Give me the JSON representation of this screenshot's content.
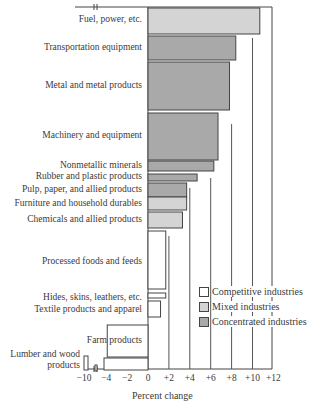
{
  "chart_data": {
    "type": "bar",
    "orientation": "horizontal",
    "title": "",
    "xlabel": "Percent change",
    "ylabel": "",
    "xlim": [
      -10,
      12
    ],
    "x_ticks": [
      "−10",
      "−4",
      "−2",
      "0",
      "+2",
      "+4",
      "+6",
      "+8",
      "+10",
      "+12"
    ],
    "axis_break": "between −10 and −4",
    "categories": [
      "Fuel, power, etc.",
      "Transportation equipment",
      "Metal and metal products",
      "Machinery and equipment",
      "Nonmetallic minerals",
      "Rubber and plastic products",
      "Pulp, paper, and allied products",
      "Furniture and household durables",
      "Chemicals and allied products",
      "Processed foods and feeds",
      "Hides, skins, leathers, etc.",
      "Textile products and apparel",
      "Farm products",
      "Lumber and wood products"
    ],
    "values": [
      10.7,
      8.4,
      7.8,
      6.7,
      6.3,
      4.7,
      3.7,
      3.7,
      3.3,
      1.7,
      1.7,
      1.2,
      -3.9,
      -10
    ],
    "industry_type": [
      "mixed",
      "concentrated",
      "concentrated",
      "concentrated",
      "concentrated",
      "concentrated",
      "concentrated",
      "mixed",
      "mixed",
      "competitive",
      "competitive",
      "competitive",
      "competitive",
      "competitive"
    ],
    "legend": [
      {
        "name": "Competitive industries",
        "color": "#ffffff"
      },
      {
        "name": "Mixed industries",
        "color": "#d4d4d4"
      },
      {
        "name": "Concentrated industries",
        "color": "#a9a9a9"
      }
    ],
    "legend_position": "lower right",
    "grid": "vertical lines"
  }
}
